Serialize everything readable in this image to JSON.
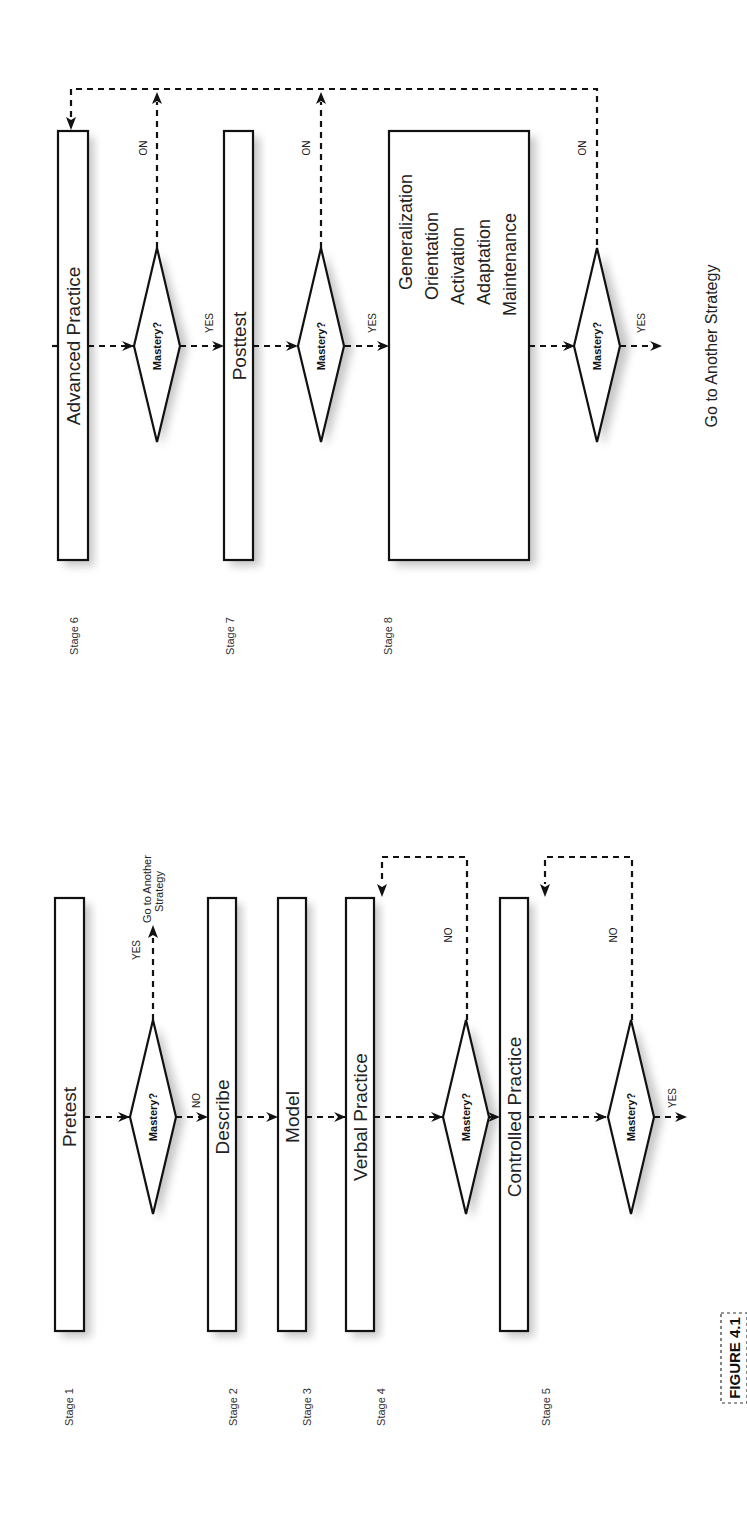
{
  "figure": {
    "label": "FIGURE 4.1",
    "orientation": "rotated 90° counterclockwise (landscape flowchart on portrait page)"
  },
  "left_panel": {
    "stages": [
      {
        "stage": "Stage 1",
        "box": "Pretest"
      },
      {
        "stage": "Stage 2",
        "box": "Describe"
      },
      {
        "stage": "Stage 3",
        "box": "Model"
      },
      {
        "stage": "Stage 4",
        "box": "Verbal Practice"
      },
      {
        "stage": "Stage 5",
        "box": "Controlled Practice"
      }
    ],
    "decisions": [
      {
        "label": "Mastery?",
        "yes": "YES",
        "no": "NO",
        "yes_target": "Go to Another Strategy",
        "no_target": "Describe"
      },
      {
        "label": "Mastery?",
        "yes": "YES",
        "no": "NO",
        "yes_target": "Controlled Practice",
        "no_target": "Verbal Practice"
      },
      {
        "label": "Mastery?",
        "yes": "YES",
        "no": "NO",
        "yes_target": "Advanced Practice",
        "no_target": "Controlled Practice"
      }
    ],
    "goto_line1": "Go to Another",
    "goto_line2": "Strategy"
  },
  "right_panel": {
    "stages": [
      {
        "stage": "Stage 6",
        "box": "Advanced Practice"
      },
      {
        "stage": "Stage 7",
        "box": "Posttest"
      },
      {
        "stage": "Stage 8",
        "box_lines": [
          "Generalization",
          "Orientation",
          "Activation",
          "Adaptation",
          "Maintenance"
        ]
      }
    ],
    "decisions": [
      {
        "label": "Mastery?",
        "yes": "YES",
        "no": "NO",
        "yes_target": "Posttest",
        "no_target": "Advanced Practice"
      },
      {
        "label": "Mastery?",
        "yes": "YES",
        "no": "NO",
        "yes_target": "Generalization",
        "no_target": "Advanced Practice"
      },
      {
        "label": "Mastery?",
        "yes": "YES",
        "no": "NO",
        "yes_target": "Go to Another Strategy",
        "no_target": "Advanced Practice"
      }
    ],
    "final_target": "Go to Another Strategy"
  },
  "colors": {
    "stroke": "#111111",
    "shadow": "#9a9a9a",
    "background": "#ffffff"
  }
}
